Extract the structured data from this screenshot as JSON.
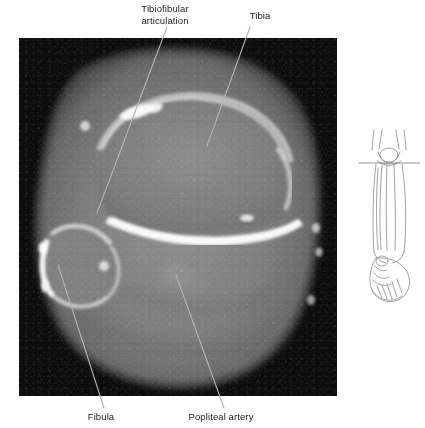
{
  "figure": {
    "type": "axial-ct-scan",
    "region": "proximal-lower-leg-knee",
    "background_color": "#ffffff",
    "scan_background_color": "#050505"
  },
  "ct_panel": {
    "name": "axial CT image",
    "x": 19,
    "y": 38,
    "width": 318,
    "height": 358
  },
  "labels": {
    "tibiofibular": {
      "line1": "Tibiofibular",
      "line2": "articulation",
      "leader": {
        "x1": 167,
        "y1": 27,
        "x2": 97,
        "y2": 213
      }
    },
    "tibia": {
      "text": "Tibia",
      "leader": {
        "x1": 250,
        "y1": 27,
        "x2": 207,
        "y2": 146
      }
    },
    "fibula": {
      "text": "Fibula",
      "leader": {
        "x1": 58,
        "y1": 265,
        "x2": 104,
        "y2": 408
      }
    },
    "popliteal_artery": {
      "text": "Popliteal artery",
      "leader": {
        "x1": 176,
        "y1": 275,
        "x2": 224,
        "y2": 408
      }
    }
  },
  "orientation_diagram": {
    "name": "leg-orientation-diagram",
    "description": "line drawing of lower leg from knee to foot",
    "slice_plane_line": "horizontal reference line at knee level",
    "stroke_color": "#8a8a8a"
  },
  "colors": {
    "leader_line": "#b0b0b0",
    "label_text": "#1a1a1a",
    "diagram_stroke": "#8c8c8c"
  }
}
